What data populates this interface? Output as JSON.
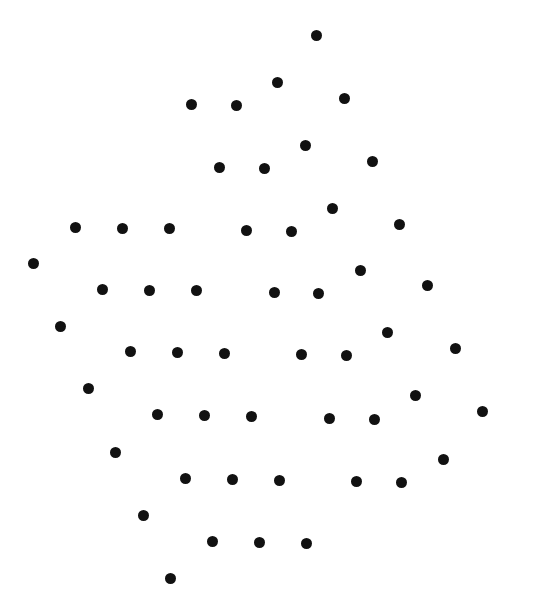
{
  "figure": {
    "background": "#ffffff",
    "dot_color": "#111111",
    "dot_diameter": 11,
    "width": 555,
    "height": 614
  },
  "dots": [
    [
      316,
      35
    ],
    [
      277,
      82
    ],
    [
      191,
      104
    ],
    [
      236,
      105
    ],
    [
      344,
      98
    ],
    [
      305,
      145
    ],
    [
      219,
      167
    ],
    [
      264,
      168
    ],
    [
      372,
      161
    ],
    [
      332,
      208
    ],
    [
      75,
      227
    ],
    [
      122,
      228
    ],
    [
      169,
      228
    ],
    [
      246,
      230
    ],
    [
      291,
      231
    ],
    [
      399,
      224
    ],
    [
      33,
      263
    ],
    [
      360,
      270
    ],
    [
      102,
      289
    ],
    [
      149,
      290
    ],
    [
      196,
      290
    ],
    [
      274,
      292
    ],
    [
      318,
      293
    ],
    [
      427,
      285
    ],
    [
      60,
      326
    ],
    [
      387,
      332
    ],
    [
      130,
      351
    ],
    [
      177,
      352
    ],
    [
      224,
      353
    ],
    [
      301,
      354
    ],
    [
      346,
      355
    ],
    [
      455,
      348
    ],
    [
      88,
      388
    ],
    [
      415,
      395
    ],
    [
      157,
      414
    ],
    [
      204,
      415
    ],
    [
      251,
      416
    ],
    [
      329,
      418
    ],
    [
      374,
      419
    ],
    [
      482,
      411
    ],
    [
      115,
      452
    ],
    [
      443,
      459
    ],
    [
      185,
      478
    ],
    [
      232,
      479
    ],
    [
      279,
      480
    ],
    [
      356,
      481
    ],
    [
      401,
      482
    ],
    [
      143,
      515
    ],
    [
      212,
      541
    ],
    [
      259,
      542
    ],
    [
      306,
      543
    ],
    [
      170,
      578
    ]
  ]
}
